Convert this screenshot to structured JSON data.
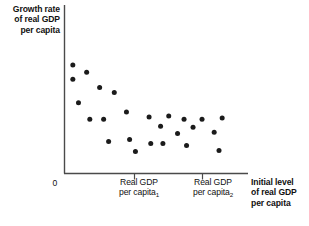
{
  "chart_data": {
    "type": "scatter",
    "title": "",
    "xlabel": "Initial level of real GDP per capita",
    "ylabel": "Growth rate of real GDP per capita",
    "grid": false,
    "legend": null,
    "xlim": [
      0,
      100
    ],
    "ylim": [
      0,
      100
    ],
    "origin_label": "0",
    "xticks": [
      {
        "value": 41,
        "label_lines": [
          "Real GDP",
          "per capita"
        ],
        "subscript": "1"
      },
      {
        "value": 82,
        "label_lines": [
          "Real GDP",
          "per capita"
        ],
        "subscript": "2"
      }
    ],
    "yticks": [],
    "annotations": [],
    "points": [
      {
        "x": 4.4,
        "y": 92.9
      },
      {
        "x": 4.4,
        "y": 80.4
      },
      {
        "x": 12.7,
        "y": 86.6
      },
      {
        "x": 20.5,
        "y": 73.2
      },
      {
        "x": 29.3,
        "y": 68.8
      },
      {
        "x": 7.8,
        "y": 59.8
      },
      {
        "x": 36.6,
        "y": 51.8
      },
      {
        "x": 14.6,
        "y": 45.5
      },
      {
        "x": 22.9,
        "y": 45.5
      },
      {
        "x": 50.2,
        "y": 47.3
      },
      {
        "x": 62.0,
        "y": 48.2
      },
      {
        "x": 71.2,
        "y": 45.5
      },
      {
        "x": 82.0,
        "y": 45.5
      },
      {
        "x": 94.1,
        "y": 46.4
      },
      {
        "x": 57.1,
        "y": 39.3
      },
      {
        "x": 76.6,
        "y": 38.4
      },
      {
        "x": 67.3,
        "y": 33.0
      },
      {
        "x": 89.3,
        "y": 33.9
      },
      {
        "x": 25.9,
        "y": 25.9
      },
      {
        "x": 38.5,
        "y": 27.7
      },
      {
        "x": 51.2,
        "y": 24.1
      },
      {
        "x": 58.5,
        "y": 24.1
      },
      {
        "x": 72.7,
        "y": 22.3
      },
      {
        "x": 42.0,
        "y": 17.0
      },
      {
        "x": 92.2,
        "y": 17.9
      }
    ]
  },
  "axes": {
    "y_label_lines": [
      "Growth rate",
      "of real GDP",
      "per capita"
    ],
    "x_label_lines": [
      "Initial level",
      "of real GDP",
      "per capita"
    ],
    "origin": "0",
    "tick1_lines": [
      "Real GDP",
      "per capita"
    ],
    "tick1_sub": "1",
    "tick2_lines": [
      "Real GDP",
      "per capita"
    ],
    "tick2_sub": "2"
  },
  "style": {
    "point_color": "#1b1b1b",
    "axis_color": "#4a4a4a",
    "text_color": "#111111",
    "background": "#ffffff"
  }
}
